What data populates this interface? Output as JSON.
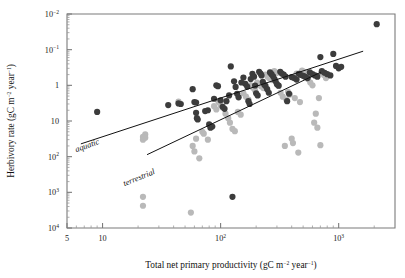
{
  "figure": {
    "title": "",
    "background": "#ffffff",
    "frame_color": "#7b7b7b"
  },
  "axes": {
    "x": {
      "label": "Total net primary productivity (gC m",
      "label_sup1": "−2",
      "label_mid": " year",
      "label_sup2": "−1",
      "label_end": ")",
      "scale": "log",
      "min": 5,
      "max": 3000,
      "ticks": [
        {
          "value": 5,
          "label": "5",
          "sup": ""
        },
        {
          "value": 10,
          "label": "10",
          "sup": ""
        },
        {
          "value": 100,
          "label": "10",
          "sup": "2"
        },
        {
          "value": 1000,
          "label": "10",
          "sup": "3"
        }
      ]
    },
    "y": {
      "label": "Herbivory rate (gC m",
      "label_sup1": "−2",
      "label_mid": " year",
      "label_sup2": "−1",
      "label_end": ")",
      "scale": "log",
      "min": 0.01,
      "max": 10000,
      "ticks": [
        {
          "value": 10000,
          "label": "10",
          "sup": "4"
        },
        {
          "value": 1000,
          "label": "10",
          "sup": "3"
        },
        {
          "value": 100,
          "label": "10",
          "sup": "2"
        },
        {
          "value": 10,
          "label": "10",
          "sup": ""
        },
        {
          "value": 1,
          "label": "1",
          "sup": ""
        },
        {
          "value": 0.1,
          "label": "10",
          "sup": "−1"
        },
        {
          "value": 0.01,
          "label": "10",
          "sup": "−2"
        }
      ]
    }
  },
  "annotations": [
    {
      "name": "aquatic",
      "text": "aquatic",
      "x_px": 88,
      "y_px": 148,
      "rotation": -20
    },
    {
      "name": "terrestrial",
      "text": "terrestrial",
      "x_px": 140,
      "y_px": 180,
      "rotation": -22
    }
  ],
  "series_colors": {
    "aquatic": "#3c3c3c",
    "terrestrial": "#b9b9b9",
    "line": "#111111"
  },
  "chart_data": {
    "type": "scatter",
    "title": "",
    "xlabel": "Total net primary productivity (gC m−2 year−1)",
    "ylabel": "Herbivory rate (gC m−2 year−1)",
    "xscale": "log",
    "yscale": "log",
    "xlim": [
      5,
      3000
    ],
    "ylim": [
      0.01,
      10000
    ],
    "grid": false,
    "legend": "inline-annotations",
    "xticks": [
      5,
      10,
      100,
      1000
    ],
    "yticks": [
      0.01,
      0.1,
      1,
      10,
      100,
      1000,
      10000
    ],
    "series": [
      {
        "name": "aquatic",
        "color": "#3c3c3c",
        "marker": "circle",
        "points": [
          [
            9.0,
            18
          ],
          [
            2100,
            5200
          ],
          [
            36,
            28
          ],
          [
            44,
            31
          ],
          [
            46,
            30
          ],
          [
            58,
            78
          ],
          [
            60,
            34
          ],
          [
            62,
            33
          ],
          [
            62,
            17
          ],
          [
            63,
            12
          ],
          [
            64,
            11
          ],
          [
            74,
            19
          ],
          [
            78,
            20
          ],
          [
            80,
            8.0
          ],
          [
            82,
            6.5
          ],
          [
            85,
            7.0
          ],
          [
            88,
            42
          ],
          [
            92,
            100
          ],
          [
            95,
            95
          ],
          [
            100,
            38
          ],
          [
            104,
            25
          ],
          [
            108,
            22
          ],
          [
            112,
            36
          ],
          [
            118,
            52
          ],
          [
            122,
            340
          ],
          [
            126,
            0.075
          ],
          [
            130,
            130
          ],
          [
            134,
            90
          ],
          [
            138,
            58
          ],
          [
            142,
            46
          ],
          [
            150,
            120
          ],
          [
            156,
            165
          ],
          [
            162,
            110
          ],
          [
            168,
            92
          ],
          [
            172,
            36
          ],
          [
            176,
            30
          ],
          [
            180,
            150
          ],
          [
            186,
            210
          ],
          [
            192,
            175
          ],
          [
            196,
            99
          ],
          [
            200,
            60
          ],
          [
            206,
            52
          ],
          [
            212,
            240
          ],
          [
            218,
            215
          ],
          [
            222,
            190
          ],
          [
            228,
            125
          ],
          [
            234,
            105
          ],
          [
            240,
            96
          ],
          [
            248,
            78
          ],
          [
            256,
            62
          ],
          [
            262,
            230
          ],
          [
            270,
            205
          ],
          [
            278,
            180
          ],
          [
            286,
            150
          ],
          [
            292,
            130
          ],
          [
            300,
            108
          ],
          [
            310,
            98
          ],
          [
            320,
            240
          ],
          [
            330,
            215
          ],
          [
            342,
            200
          ],
          [
            355,
            175
          ],
          [
            366,
            36
          ],
          [
            380,
            58
          ],
          [
            400,
            170
          ],
          [
            420,
            160
          ],
          [
            440,
            145
          ],
          [
            460,
            210
          ],
          [
            480,
            195
          ],
          [
            500,
            185
          ],
          [
            520,
            175
          ],
          [
            545,
            160
          ],
          [
            570,
            230
          ],
          [
            600,
            205
          ],
          [
            630,
            190
          ],
          [
            660,
            175
          ],
          [
            700,
            620
          ],
          [
            720,
            250
          ],
          [
            760,
            225
          ],
          [
            800,
            205
          ],
          [
            850,
            190
          ],
          [
            900,
            760
          ],
          [
            950,
            350
          ],
          [
            1000,
            300
          ],
          [
            1050,
            330
          ]
        ]
      },
      {
        "name": "terrestrial",
        "color": "#b9b9b9",
        "marker": "circle",
        "points": [
          [
            22,
            3.6
          ],
          [
            22,
            3.0
          ],
          [
            23,
            4.2
          ],
          [
            23,
            3.4
          ],
          [
            22,
            0.075
          ],
          [
            22,
            0.042
          ],
          [
            44,
            35
          ],
          [
            56,
            0.027
          ],
          [
            58,
            2.0
          ],
          [
            60,
            1.4
          ],
          [
            62,
            3.2
          ],
          [
            66,
            0.9
          ],
          [
            70,
            5.0
          ],
          [
            72,
            4.4
          ],
          [
            78,
            3.0
          ],
          [
            88,
            26
          ],
          [
            92,
            21
          ],
          [
            96,
            34
          ],
          [
            100,
            28
          ],
          [
            104,
            24
          ],
          [
            110,
            16
          ],
          [
            116,
            12
          ],
          [
            120,
            9.0
          ],
          [
            126,
            6.0
          ],
          [
            132,
            5.2
          ],
          [
            140,
            18
          ],
          [
            148,
            15
          ],
          [
            156,
            60
          ],
          [
            164,
            48
          ],
          [
            172,
            40
          ],
          [
            180,
            100
          ],
          [
            188,
            85
          ],
          [
            196,
            72
          ],
          [
            204,
            120
          ],
          [
            212,
            105
          ],
          [
            220,
            95
          ],
          [
            230,
            84
          ],
          [
            240,
            200
          ],
          [
            250,
            175
          ],
          [
            260,
            155
          ],
          [
            272,
            140
          ],
          [
            285,
            250
          ],
          [
            298,
            220
          ],
          [
            310,
            96
          ],
          [
            322,
            62
          ],
          [
            336,
            48
          ],
          [
            350,
            2.0
          ],
          [
            360,
            40
          ],
          [
            372,
            66
          ],
          [
            386,
            55
          ],
          [
            400,
            3.2
          ],
          [
            410,
            2.4
          ],
          [
            425,
            44
          ],
          [
            440,
            215
          ],
          [
            455,
            1.3
          ],
          [
            470,
            34
          ],
          [
            490,
            260
          ],
          [
            510,
            240
          ],
          [
            530,
            170
          ],
          [
            550,
            150
          ],
          [
            575,
            120
          ],
          [
            600,
            100
          ],
          [
            620,
            9.0
          ],
          [
            640,
            16
          ],
          [
            660,
            6.5
          ],
          [
            680,
            44
          ],
          [
            700,
            2.1
          ],
          [
            720,
            230
          ],
          [
            750,
            195
          ],
          [
            780,
            160
          ]
        ]
      }
    ],
    "fit_lines": [
      {
        "name": "aquatic",
        "x0": 6.6,
        "y0": 2.3,
        "x1": 1600,
        "y1": 900
      },
      {
        "name": "terrestrial",
        "x0": 24,
        "y0": 1.15,
        "x1": 700,
        "y1": 230
      }
    ]
  }
}
